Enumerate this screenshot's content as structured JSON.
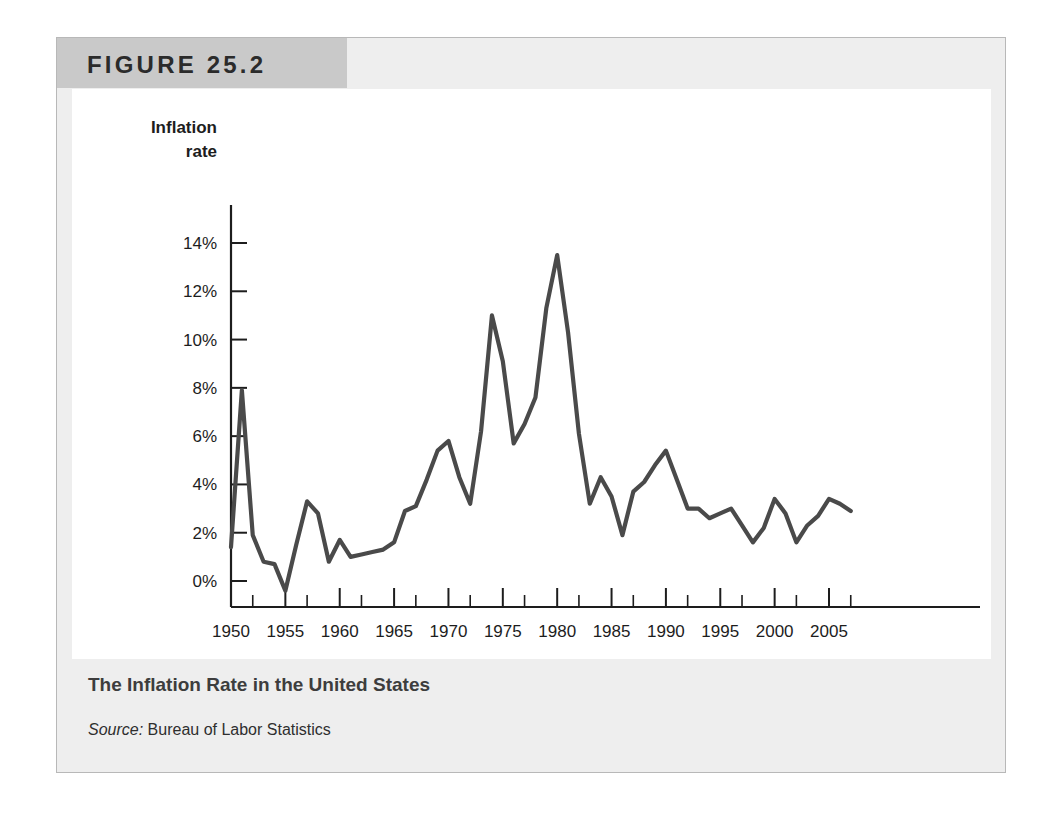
{
  "figure": {
    "tag_label": "FIGURE 25.2",
    "caption_title": "The Inflation Rate in the United States",
    "source_prefix": "Source:",
    "source_text": " Bureau of Labor Statistics"
  },
  "colors": {
    "page_background": "#ffffff",
    "card_background": "#eeeeee",
    "card_border": "#b8b8b8",
    "tag_background": "#c9c9c9",
    "plot_background": "#ffffff",
    "line_color": "#4a4a4a",
    "axis_color": "#1d1d1d",
    "text_color": "#1d1d1d",
    "caption_title_color": "#3d3d3d"
  },
  "chart_data": {
    "type": "line",
    "title": "The Inflation Rate in the United States",
    "subtitle": "",
    "xlabel": "Year",
    "ylabel": "Inflation rate",
    "ylabel_line1": "Inflation",
    "ylabel_line2": "rate",
    "grid": false,
    "legend": false,
    "legend_position": "none",
    "xlim": [
      1949,
      2008
    ],
    "ylim": [
      -1.5,
      14.8
    ],
    "xticks": [
      1950,
      1955,
      1960,
      1965,
      1970,
      1975,
      1980,
      1985,
      1990,
      1995,
      2000,
      2005
    ],
    "xtick_labels": [
      "1950",
      "1955",
      "1960",
      "1965",
      "1970",
      "1975",
      "1980",
      "1985",
      "1990",
      "1995",
      "2000",
      "2005"
    ],
    "xticks_minor": [
      1952,
      1957,
      1962,
      1967,
      1972,
      1977,
      1982,
      1987,
      1992,
      1997,
      2002,
      2007
    ],
    "yticks": [
      0,
      2,
      4,
      6,
      8,
      10,
      12,
      14
    ],
    "ytick_labels": [
      "0%",
      "2%",
      "4%",
      "6%",
      "8%",
      "10%",
      "12%",
      "14%"
    ],
    "series": [
      {
        "name": "Inflation rate",
        "color": "#4a4a4a",
        "x": [
          1950,
          1951,
          1952,
          1953,
          1954,
          1955,
          1956,
          1957,
          1958,
          1959,
          1960,
          1961,
          1962,
          1963,
          1964,
          1965,
          1966,
          1967,
          1968,
          1969,
          1970,
          1971,
          1972,
          1973,
          1974,
          1975,
          1976,
          1977,
          1978,
          1979,
          1980,
          1981,
          1982,
          1983,
          1984,
          1985,
          1986,
          1987,
          1988,
          1989,
          1990,
          1991,
          1992,
          1993,
          1994,
          1995,
          1996,
          1997,
          1998,
          1999,
          2000,
          2001,
          2002,
          2003,
          2004,
          2005,
          2006,
          2007
        ],
        "values": [
          1.4,
          7.9,
          1.9,
          0.8,
          0.7,
          -0.4,
          1.5,
          3.3,
          2.8,
          0.8,
          1.7,
          1.0,
          1.1,
          1.2,
          1.3,
          1.6,
          2.9,
          3.1,
          4.2,
          5.4,
          5.8,
          4.3,
          3.2,
          6.2,
          11.0,
          9.1,
          5.7,
          6.5,
          7.6,
          11.3,
          13.5,
          10.3,
          6.1,
          3.2,
          4.3,
          3.5,
          1.9,
          3.7,
          4.1,
          4.8,
          5.4,
          4.2,
          3.0,
          3.0,
          2.6,
          2.8,
          3.0,
          2.3,
          1.6,
          2.2,
          3.4,
          2.8,
          1.6,
          2.3,
          2.7,
          3.4,
          3.2,
          2.9
        ]
      }
    ],
    "annotations": []
  }
}
